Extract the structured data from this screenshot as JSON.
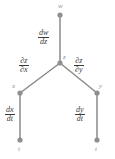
{
  "diagram": {
    "type": "chain-rule-tree",
    "title": "",
    "colors": {
      "node": "#8f8f8f",
      "edge": "#8a8a8a",
      "label_text": "#3b3b3b",
      "node_label_text": "#8a8a8a",
      "background": "#ffffff"
    },
    "nodes": [
      {
        "id": "w",
        "label": "w",
        "x": 60,
        "y": 15,
        "label_x": 58,
        "label_y": 3
      },
      {
        "id": "z",
        "label": "z",
        "x": 60,
        "y": 63,
        "label_x": 63,
        "label_y": 54
      },
      {
        "id": "x",
        "label": "x",
        "x": 20,
        "y": 93,
        "label_x": 12,
        "label_y": 83
      },
      {
        "id": "y",
        "label": "y",
        "x": 97,
        "y": 93,
        "label_x": 99,
        "label_y": 83
      },
      {
        "id": "t1",
        "label": "t",
        "x": 20,
        "y": 140,
        "label_x": 18,
        "label_y": 146
      },
      {
        "id": "t2",
        "label": "t",
        "x": 97,
        "y": 140,
        "label_x": 95,
        "label_y": 146
      }
    ],
    "edges": [
      {
        "from": "w",
        "to": "z",
        "numerator": "dw",
        "denominator": "dz",
        "label_x": 38,
        "label_y": 29
      },
      {
        "from": "z",
        "to": "x",
        "numerator": "∂z",
        "denominator": "∂x",
        "label_x": 19,
        "label_y": 57
      },
      {
        "from": "z",
        "to": "y",
        "numerator": "∂z",
        "denominator": "∂y",
        "label_x": 74,
        "label_y": 57
      },
      {
        "from": "x",
        "to": "t1",
        "numerator": "dx",
        "denominator": "dt",
        "label_x": 5,
        "label_y": 106
      },
      {
        "from": "y",
        "to": "t2",
        "numerator": "dy",
        "denominator": "dt",
        "label_x": 75,
        "label_y": 106
      }
    ]
  }
}
